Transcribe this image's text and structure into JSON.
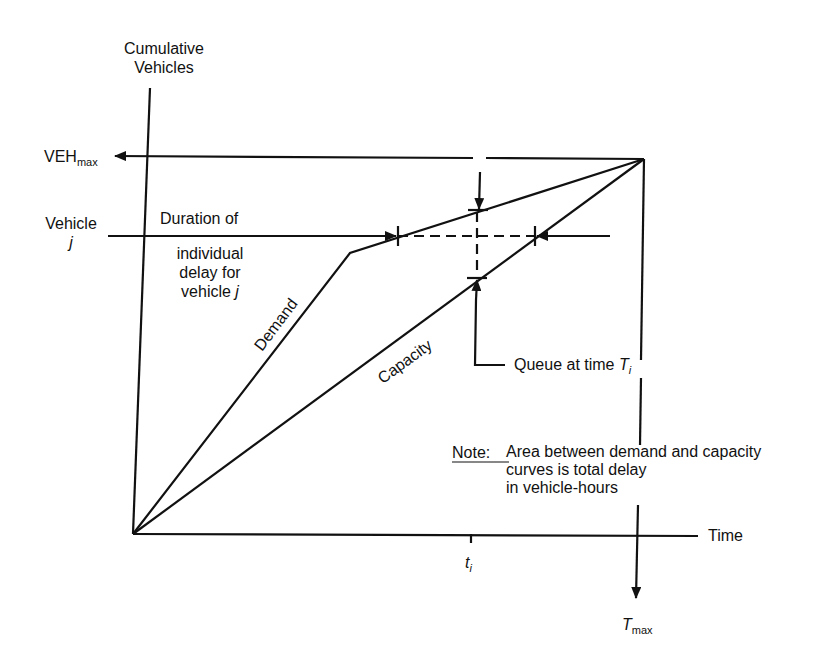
{
  "diagram": {
    "y_axis_label_line1": "Cumulative",
    "y_axis_label_line2": "Vehicles",
    "x_axis_label": "Time",
    "vehmax_main": "VEH",
    "vehmax_sub": "max",
    "vehicle_j_line1": "Vehicle",
    "vehicle_j_line2": "j",
    "duration_line1": "Duration of",
    "duration_line2": "individual",
    "duration_line3": "delay for",
    "duration_line4_text": "vehicle ",
    "duration_line4_var": "j",
    "demand_label": "Demand",
    "capacity_label": "Capacity",
    "queue_label_text": "Queue at time ",
    "queue_label_var": "T",
    "queue_label_sub": "i",
    "note_prefix": "Note:",
    "note_line1": "Area between demand and capacity",
    "note_line2": "curves is total delay",
    "note_line3": "in vehicle-hours",
    "ti_main": "t",
    "ti_sub": "i",
    "tmax_main": "T",
    "tmax_sub": "max"
  },
  "geometry": {
    "origin": [
      133,
      534
    ],
    "apex": [
      644,
      159
    ],
    "demand_knee": [
      350,
      253
    ],
    "vehicle_j_y": 236,
    "t_i_x": 477,
    "demand_at_vehicle_j": [
      398,
      236
    ],
    "capacity_at_vehicle_j": [
      535,
      236
    ],
    "demand_at_t_i": [
      477,
      210
    ],
    "capacity_at_t_i": [
      477,
      278
    ]
  }
}
